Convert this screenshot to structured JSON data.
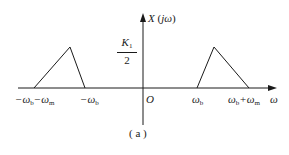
{
  "figure": {
    "y_axis_label": {
      "main": "X",
      "paren_open": " (",
      "arg": "jω",
      "paren_close": ")"
    },
    "amplitude": {
      "numerator_main": "K",
      "numerator_sub": "1",
      "denominator": "2"
    },
    "origin_label": "O",
    "x_axis_label": "ω",
    "ticks": {
      "neg_outer": {
        "a": "−ω",
        "a_sub": "b",
        "b": "−ω",
        "b_sub": "m"
      },
      "neg_inner": {
        "a": "−ω",
        "a_sub": "b"
      },
      "pos_inner": {
        "a": "ω",
        "a_sub": "b"
      },
      "pos_outer": {
        "a": "ω",
        "a_sub": "b",
        "plus": "+ω",
        "b_sub": "m"
      }
    },
    "caption": "( a )",
    "colors": {
      "line": "#1a1a1a",
      "background": "#ffffff"
    }
  }
}
